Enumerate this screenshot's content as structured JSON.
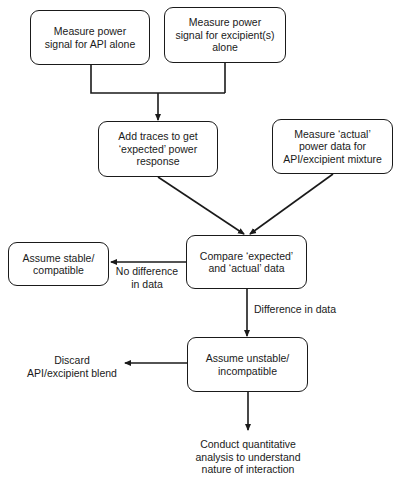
{
  "nodes": {
    "measure_api": "Measure power\nsignal for API alone",
    "measure_excipient": "Measure power\nsignal for excipient(s)\nalone",
    "add_traces": "Add traces to get\n‘expected’ power\nresponse",
    "measure_actual": "Measure ‘actual’\npower data for\nAPI/excipient mixture",
    "assume_stable": "Assume stable/\ncompatible",
    "compare": "Compare ‘expected’\nand ‘actual’ data",
    "assume_unstable": "Assume unstable/\nincompatible"
  },
  "terminals": {
    "discard": "Discard\nAPI/excipient blend",
    "conduct": "Conduct quantitative\nanalysis to understand\nnature of interaction"
  },
  "edge_labels": {
    "no_difference": "No difference\nin data",
    "difference": "Difference in data"
  },
  "colors": {
    "stroke": "#1a1a1a",
    "background": "#ffffff"
  }
}
